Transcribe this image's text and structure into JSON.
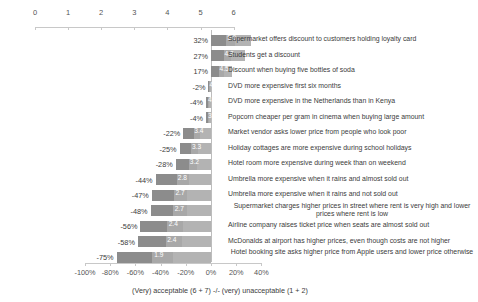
{
  "chart_data": {
    "type": "bar",
    "title": "",
    "subtitle": "",
    "caption": "(Very) acceptable (6 + 7) -/- (very) unacceptable (1 + 2)",
    "xlabel": "",
    "ylabel": "",
    "orientation": "horizontal",
    "grid": false,
    "legend": "none",
    "top_axis": {
      "name": "mean-score-axis",
      "ticks": [
        0,
        1,
        2,
        3,
        4,
        5,
        6
      ],
      "tick_labels": [
        "0",
        "1",
        "2",
        "3",
        "4",
        "5",
        "6"
      ],
      "range": [
        0,
        6
      ]
    },
    "bottom_axis": {
      "name": "net-acceptability-axis",
      "ticks": [
        -100,
        -80,
        -60,
        -40,
        -20,
        0,
        20,
        40
      ],
      "tick_labels": [
        "-100%",
        "-80%",
        "-60%",
        "-40%",
        "-20%",
        "0%",
        "20%",
        "40%"
      ],
      "range": [
        -100,
        40
      ]
    },
    "categories": [
      "Supermarket offers discount to customers holding loyalty card",
      "Students get a discount",
      "Discount when buying five bottles of soda",
      "DVD more expensive first six months",
      "DVD more expensive in the Netherlands than in Kenya",
      "Popcorn cheaper per gram in cinema when buying large amount",
      "Market vendor asks lower price from people who look poor",
      "Holiday cottages are more expensive during school holidays",
      "Hotel room more expensive during week than on weekend",
      "Umbrella more expensive when it rains and almost sold out",
      "Umbrella more expensive when it rains and not sold out",
      "Supermarket charges higher prices in street where rent is very high  and lower prices where rent is low",
      "Airline company raises ticket price when seats are almost sold out",
      "McDonalds at airport has higher prices, even though costs are not higher",
      "Hotel booking site asks higher price from Apple users and lower price otherwise"
    ],
    "series": [
      {
        "name": "Net acceptability (%)",
        "values": [
          32,
          27,
          17,
          -2,
          -4,
          -4,
          -22,
          -25,
          -28,
          -44,
          -47,
          -48,
          -56,
          -58,
          -75
        ],
        "labels": [
          "32%",
          "27%",
          "17%",
          "-2%",
          "-4%",
          "-4%",
          "-22%",
          "-25%",
          "-28%",
          "-44%",
          "-47%",
          "-48%",
          "-56%",
          "-58%",
          "-75%"
        ]
      },
      {
        "name": "Mean score (1-7)",
        "values": [
          5.0,
          4.8,
          4.5,
          4.0,
          4.0,
          3.8,
          3.4,
          3.3,
          3.2,
          2.8,
          2.7,
          2.7,
          2.4,
          2.4,
          1.9
        ],
        "labels": [
          "5.0",
          "4.8",
          "4.5",
          "4.0",
          "4.0",
          "3.8",
          "3.4",
          "3.3",
          "3.2",
          "2.8",
          "2.7",
          "2.7",
          "2.4",
          "2.4",
          "1.9"
        ]
      }
    ],
    "colors": {
      "bar_dark": "#8c8c8c",
      "bar_mid": "#a8a8a8",
      "bar_light": "#b3b3b3",
      "axis": "#c8c8c8",
      "text": "#3b3b3b",
      "background": "#ffffff"
    }
  }
}
